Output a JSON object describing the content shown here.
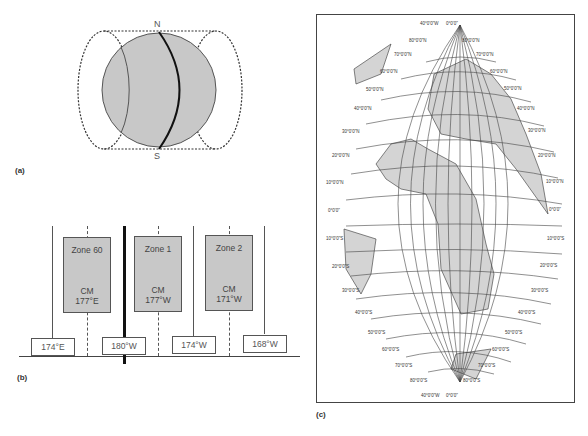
{
  "panel_a": {
    "label": "(a)",
    "north_label": "N",
    "south_label": "S",
    "colors": {
      "globe_fill": "#c8c8c8",
      "outline": "#555555",
      "meridian": "#111111"
    }
  },
  "panel_b": {
    "label": "(b)",
    "zones": [
      {
        "name": "Zone 60",
        "cm_label": "CM",
        "cm_value": "177°E"
      },
      {
        "name": "Zone 1",
        "cm_label": "CM",
        "cm_value": "177°W"
      },
      {
        "name": "Zone 2",
        "cm_label": "CM",
        "cm_value": "171°W"
      }
    ],
    "boundaries": [
      "174°E",
      "180°W",
      "174°W",
      "168°W"
    ],
    "colors": {
      "zone_fill": "#c8c8c8"
    }
  },
  "panel_c": {
    "label": "(c)",
    "apex_top": {
      "left": "40°0'0\"W",
      "right": "0°0'0\""
    },
    "apex_bottom": {
      "left": "40°0'0\"W",
      "right": "0°0'0\""
    },
    "left_labels_north": [
      "80°0'0\"N",
      "70°0'0\"N",
      "60°0'0\"N",
      "50°0'0\"N",
      "40°0'0\"N",
      "30°0'0\"N",
      "20°0'0\"N",
      "10°0'0\"N",
      "0°0'0\""
    ],
    "right_labels_north": [
      "80°0'0\"N",
      "70°0'0\"N",
      "60°0'0\"N",
      "50°0'0\"N",
      "40°0'0\"N",
      "30°0'0\"N",
      "20°0'0\"N",
      "10°0'0\"N",
      "0°0'0\""
    ],
    "left_labels_south": [
      "10°0'0\"S",
      "20°0'0\"S",
      "30°0'0\"S",
      "40°0'0\"S",
      "50°0'0\"S",
      "60°0'0\"S",
      "70°0'0\"S",
      "80°0'0\"S"
    ],
    "right_labels_south": [
      "10°0'0\"S",
      "20°0'0\"S",
      "30°0'0\"S",
      "40°0'0\"S",
      "50°0'0\"S",
      "60°0'0\"S",
      "70°0'0\"S",
      "80°0'0\"S"
    ],
    "colors": {
      "land": "#d4d4d4",
      "grid": "#444444"
    }
  }
}
